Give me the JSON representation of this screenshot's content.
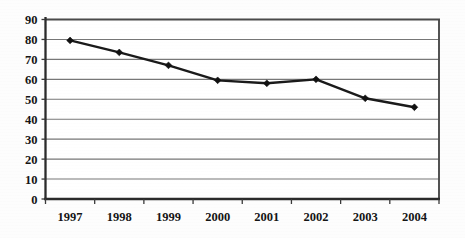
{
  "chart_data": {
    "type": "line",
    "title": "",
    "subtitle": "",
    "xlabel": "",
    "ylabel": "",
    "categories": [
      "1997",
      "1998",
      "1999",
      "2000",
      "2001",
      "2002",
      "2003",
      "2004"
    ],
    "values": [
      79.5,
      73.5,
      67,
      59.5,
      58,
      60,
      50.5,
      46
    ],
    "series": [
      {
        "name": "",
        "values": [
          79.5,
          73.5,
          67,
          59.5,
          58,
          60,
          50.5,
          46
        ]
      }
    ],
    "ylim": [
      0,
      90
    ],
    "ytick_labels": [
      "0",
      "10",
      "20",
      "30",
      "40",
      "50",
      "60",
      "70",
      "80",
      "90"
    ],
    "ytick_values": [
      0,
      10,
      20,
      30,
      40,
      50,
      60,
      70,
      80,
      90
    ],
    "xtick_labels": [
      "1997",
      "1998",
      "1999",
      "2000",
      "2001",
      "2002",
      "2003",
      "2004"
    ],
    "grid": "horizontal",
    "legend": "none",
    "marker": "diamond",
    "line_color": "#1a1a1a",
    "grid_color": "#777777",
    "axis_color": "#2b2b2b",
    "background_color": "#fdfdfd",
    "annotations": []
  }
}
